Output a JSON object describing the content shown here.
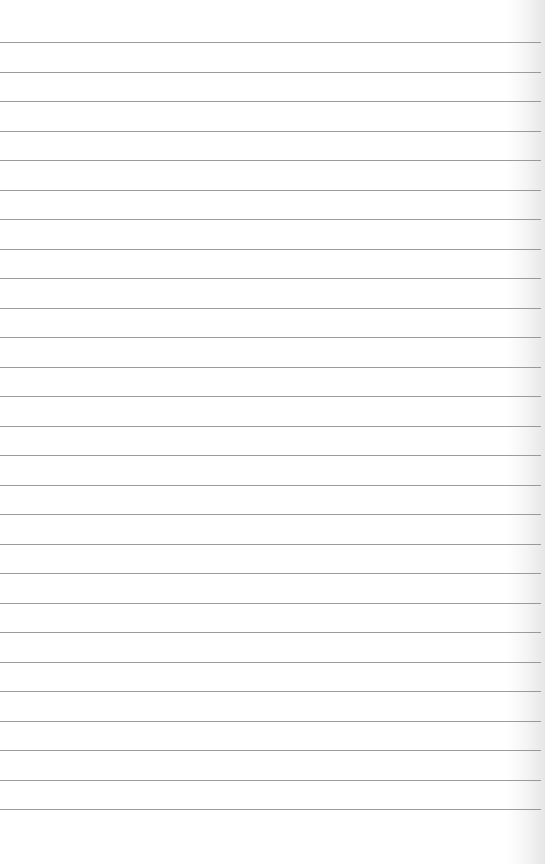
{
  "page": {
    "type": "lined-paper",
    "background_color": "#ffffff",
    "rule_color": "#8a8a8a",
    "rule_count": 27,
    "first_rule_y": 42,
    "rule_spacing": 29.5,
    "text": ""
  }
}
